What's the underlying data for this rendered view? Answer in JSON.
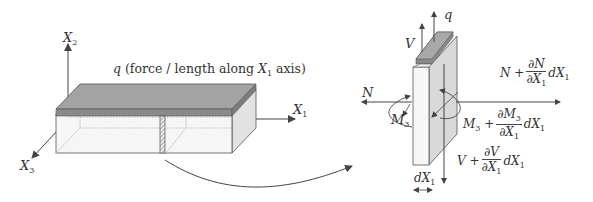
{
  "colors": {
    "line": "#444444",
    "top_face": "#9a9a9a",
    "top_edge": "#7a7a7a",
    "side_face": "#d8d8d8",
    "front_face": "#f4f4f4"
  },
  "left_panel": {
    "axes": {
      "x1": {
        "symbol": "X",
        "sub": "1"
      },
      "x2": {
        "symbol": "X",
        "sub": "2"
      },
      "x3": {
        "symbol": "X",
        "sub": "3"
      }
    },
    "load_label": {
      "symbol": "q",
      "text_before": " (force / length along ",
      "axis_symbol": "X",
      "axis_sub": "1",
      "text_after": " axis)"
    }
  },
  "right_panel": {
    "q": "q",
    "V": "V",
    "N": "N",
    "M3": {
      "symbol": "M",
      "sub": "3"
    },
    "N_plus": {
      "lhs": "N +",
      "num": "∂N",
      "den_sym": "∂X",
      "den_sub": "1",
      "tail_sym": "dX",
      "tail_sub": "1"
    },
    "M_plus": {
      "lhs_sym": "M",
      "lhs_sub": "3",
      "plus": " +",
      "num_sym": "∂M",
      "num_sub": "3",
      "den_sym": "∂X",
      "den_sub": "1",
      "tail_sym": "dX",
      "tail_sub": "1"
    },
    "V_plus": {
      "lhs": "V +",
      "num": "∂V",
      "den_sym": "∂X",
      "den_sub": "1",
      "tail_sym": "dX",
      "tail_sub": "1"
    },
    "dx": {
      "symbol": "dX",
      "sub": "1"
    }
  }
}
